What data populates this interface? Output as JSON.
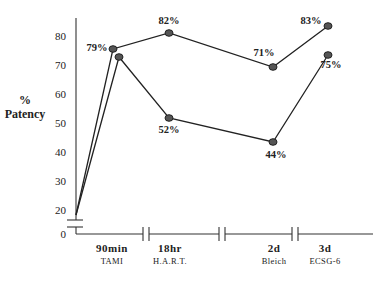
{
  "chart_data": {
    "type": "line",
    "title": "",
    "xlabel": "",
    "ylabel_lines": [
      "%",
      "Patency"
    ],
    "ylim": [
      0,
      85
    ],
    "y_ticks": [
      {
        "label": "80",
        "y": 40
      },
      {
        "label": "70",
        "y": 69
      },
      {
        "label": "60",
        "y": 98
      },
      {
        "label": "50",
        "y": 127
      },
      {
        "label": "40",
        "y": 156
      },
      {
        "label": "30",
        "y": 185
      },
      {
        "label": "20",
        "y": 214
      },
      {
        "label": "0",
        "y": 238
      }
    ],
    "categories": [
      {
        "time": "90min",
        "study": "TAMI",
        "x": 112
      },
      {
        "time": "18hr",
        "study": "H.A.R.T.",
        "x": 170
      },
      {
        "time": "2d",
        "study": "Bleich",
        "x": 274
      },
      {
        "time": "3d",
        "study": "ECSG-6",
        "x": 325
      }
    ],
    "origin": {
      "x": 76,
      "y": 215,
      "value": 20
    },
    "series": [
      {
        "name": "upper",
        "values": [
          79,
          82,
          71,
          83
        ],
        "labels": [
          "79%",
          "82%",
          "71%",
          "83%"
        ],
        "points": [
          [
            113,
            49
          ],
          [
            169,
            33
          ],
          [
            273,
            67
          ],
          [
            328,
            26
          ]
        ],
        "label_pos": [
          [
            97,
            51
          ],
          [
            169,
            24
          ],
          [
            264,
            56
          ],
          [
            311,
            24
          ]
        ]
      },
      {
        "name": "lower",
        "values": [
          75,
          52,
          44,
          75
        ],
        "labels": [
          "",
          "52%",
          "44%",
          "75%"
        ],
        "points": [
          [
            119,
            57
          ],
          [
            169,
            118
          ],
          [
            273,
            142
          ],
          [
            328,
            55
          ]
        ],
        "label_pos": [
          [
            0,
            0
          ],
          [
            169,
            133
          ],
          [
            276,
            158
          ],
          [
            331,
            68
          ]
        ]
      }
    ],
    "x_axis_breaks": [
      146,
      222,
      295
    ],
    "x_axis_range": [
      76,
      373
    ],
    "grid": false,
    "legend": null
  }
}
